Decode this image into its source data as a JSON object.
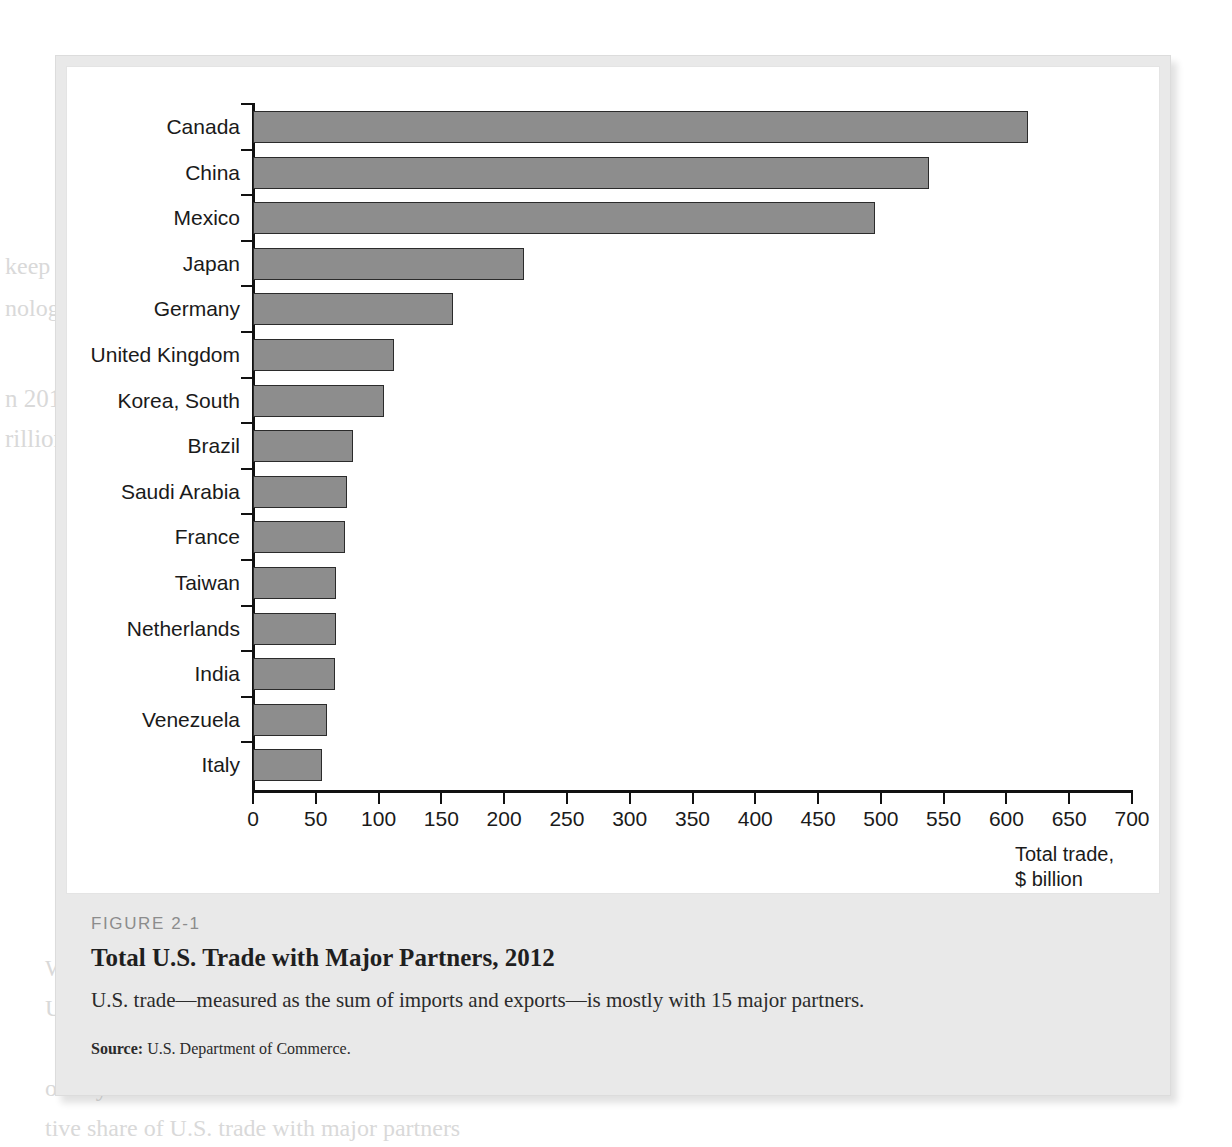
{
  "figure": {
    "number": "FIGURE 2-1",
    "title": "Total U.S. Trade with Major Partners, 2012",
    "subtitle": "U.S. trade—measured as the sum of imports and exports—is mostly with 15 major partners.",
    "source_label": "Source:",
    "source_text": " U.S. Department of Commerce."
  },
  "axis_title": "Total trade,\n$ billion",
  "colors": {
    "bar_fill": "#8d8d8d",
    "bar_outline": "#2b2b2b",
    "axis": "#111111",
    "plate": "#ffffff",
    "panel": "#e9e9e9",
    "figure_number": "#8c8c8c"
  },
  "bleed_text": [
    "The top trading",
    "Consumers and firms",
    "their goods with the comp",
    "States.",
    "keep its goods",
    "nology in foreig",
    "n 2012, the world as a whole produced goods and services worth about $70",
    "rillion at current prices. Of this total, more than 30% was sold across border",
    "World Output, Exports, Imports",
    "United States, 1970–2013",
    "ountry's share of the total trade of the United States",
    "tive share of U.S. trade with major partners"
  ],
  "chart_data": {
    "type": "bar",
    "orientation": "horizontal",
    "title": "Total U.S. Trade with Major Partners, 2012",
    "xlabel": "Total trade, $ billion",
    "ylabel": "",
    "xlim": [
      0,
      700
    ],
    "xticks": [
      0,
      50,
      100,
      150,
      200,
      250,
      300,
      350,
      400,
      450,
      500,
      550,
      600,
      650,
      700
    ],
    "grid": false,
    "legend": false,
    "units": "$ billion",
    "categories": [
      "Canada",
      "China",
      "Mexico",
      "Japan",
      "Germany",
      "United Kingdom",
      "Korea, South",
      "Brazil",
      "Saudi Arabia",
      "France",
      "Taiwan",
      "Netherlands",
      "India",
      "Venezuela",
      "Italy"
    ],
    "values": [
      617,
      538,
      495,
      216,
      159,
      112,
      104,
      80,
      75,
      73,
      66,
      66,
      65,
      59,
      55
    ]
  }
}
